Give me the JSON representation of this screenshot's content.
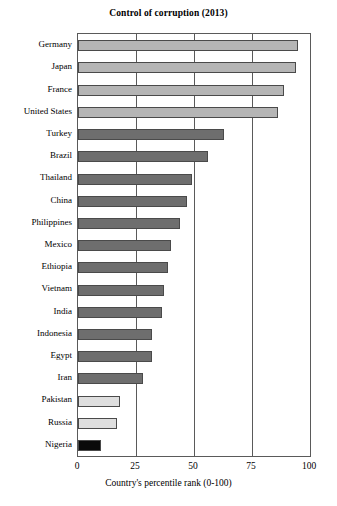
{
  "chart_data": {
    "type": "bar",
    "orientation": "horizontal",
    "title": "Control of corruption (2013)",
    "xlabel": "Country's percentile rank (0-100)",
    "ylabel": "",
    "xlim": [
      0,
      100
    ],
    "xticks": [
      0,
      25,
      50,
      75,
      100
    ],
    "grid": true,
    "legend": false,
    "categories": [
      "Germany",
      "Japan",
      "France",
      "United States",
      "Turkey",
      "Brazil",
      "Thailand",
      "China",
      "Philippines",
      "Mexico",
      "Ethiopia",
      "Vietnam",
      "India",
      "Indonesia",
      "Egypt",
      "Iran",
      "Pakistan",
      "Russia",
      "Nigeria"
    ],
    "values": [
      95,
      94,
      89,
      86,
      63,
      56,
      49,
      47,
      44,
      40,
      39,
      37,
      36,
      32,
      32,
      28,
      18,
      17,
      10
    ],
    "bar_colors": [
      "#b5b5b5",
      "#b5b5b5",
      "#b5b5b5",
      "#b5b5b5",
      "#6e6e6e",
      "#6e6e6e",
      "#6e6e6e",
      "#6e6e6e",
      "#6e6e6e",
      "#6e6e6e",
      "#6e6e6e",
      "#6e6e6e",
      "#6e6e6e",
      "#6e6e6e",
      "#6e6e6e",
      "#6e6e6e",
      "#dedede",
      "#dedede",
      "#0a0a0a"
    ]
  },
  "colors": {
    "frame": "#5a5a5a",
    "bar_outline": "#4a4a4a",
    "background": "#ffffff",
    "text": "#000000"
  }
}
